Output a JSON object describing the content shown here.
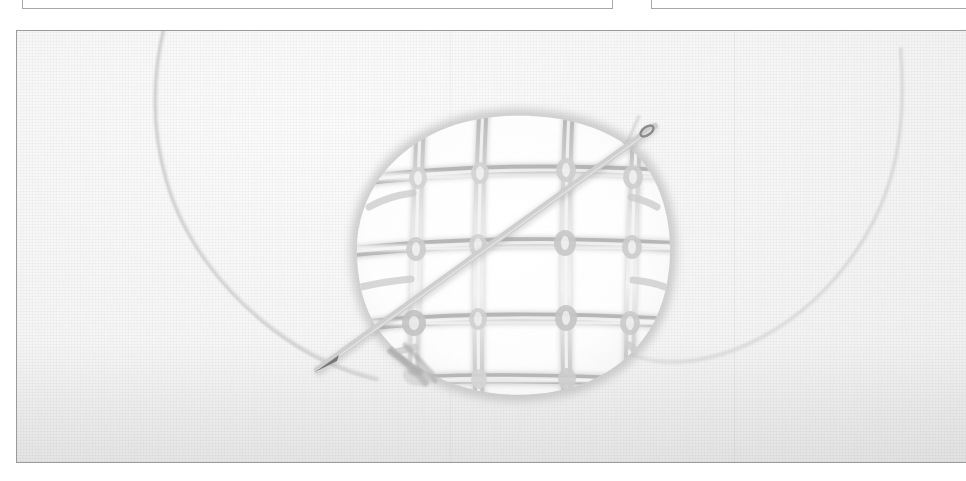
{
  "page": {
    "background_color": "#ffffff",
    "width": 966,
    "height": 481
  },
  "top_frames": [
    {
      "name": "cropped-panel-left",
      "border_color": "#a8a8a8",
      "fill": "#ffffff",
      "visible_text": ""
    },
    {
      "name": "cropped-panel-right",
      "border_color": "#a8a8a8",
      "fill": "#ffffff",
      "visible_text": ""
    }
  ],
  "photo": {
    "caption": "",
    "border_color": "#9b9b9b",
    "fabric_color": "#f3f3f3",
    "thread_color": "#c9c9c9",
    "thread_shadow_color": "#a5a5a5",
    "needle_color": "#8d8d8d",
    "hole_color": "#ffffff",
    "subject": "darning-weave-over-hole-with-needle",
    "elements": {
      "hole": "oval opening in fabric",
      "lattice": "woven grid of laid threads spanning the hole",
      "needle": "straight sewing needle crossing the weave diagonally",
      "working_thread": "single strand trailing from the needle eye",
      "loose_thread_loop": "thread curving down the left of the frame"
    },
    "seams_x": [
      449,
      733
    ],
    "visible_text": ""
  }
}
